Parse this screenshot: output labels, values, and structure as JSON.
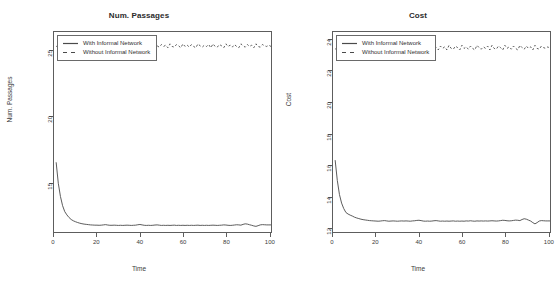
{
  "figure": {
    "background": "#ffffff",
    "line_color": "#4a4a4a",
    "axis_color": "#5d5d5d"
  },
  "panels": [
    {
      "id": "num-passages",
      "title": "Num. Passages",
      "xlabel": "Time",
      "ylabel": "Num. Passages",
      "legend": {
        "solid_label": "With Informal Network",
        "dashed_label": "Without Informal Network"
      },
      "yticks": [
        "15",
        "20",
        "25"
      ],
      "xticks": [
        "0",
        "20",
        "40",
        "60",
        "80",
        "100"
      ]
    },
    {
      "id": "cost",
      "title": "Cost",
      "xlabel": "Time",
      "ylabel": "Cost",
      "legend": {
        "solid_label": "With Informal Network",
        "dashed_label": "Without Informal Network"
      },
      "yticks": [
        "12",
        "14",
        "16",
        "18",
        "20",
        "22",
        "24"
      ],
      "xticks": [
        "0",
        "20",
        "40",
        "60",
        "80",
        "100"
      ]
    }
  ],
  "chart_data": [
    {
      "type": "line",
      "title": "Num. Passages",
      "xlabel": "Time",
      "ylabel": "Num. Passages",
      "xlim": [
        0,
        101
      ],
      "ylim": [
        11.2,
        26.4
      ],
      "grid": false,
      "legend_position": "top-left",
      "yticks": [
        15,
        20,
        25
      ],
      "xticks": [
        0,
        20,
        40,
        60,
        80,
        100
      ],
      "series": [
        {
          "name": "With Informal Network",
          "style": "solid",
          "x": [
            1,
            2,
            3,
            4,
            5,
            6,
            7,
            8,
            9,
            10,
            11,
            12,
            13,
            14,
            15,
            16,
            17,
            18,
            19,
            20,
            21,
            22,
            23,
            24,
            25,
            26,
            27,
            28,
            29,
            30,
            31,
            32,
            33,
            34,
            35,
            36,
            37,
            38,
            39,
            40,
            41,
            42,
            43,
            44,
            45,
            46,
            47,
            48,
            49,
            50,
            51,
            52,
            53,
            54,
            55,
            56,
            57,
            58,
            59,
            60,
            61,
            62,
            63,
            64,
            65,
            66,
            67,
            68,
            69,
            70,
            71,
            72,
            73,
            74,
            75,
            76,
            77,
            78,
            79,
            80,
            81,
            82,
            83,
            84,
            85,
            86,
            87,
            88,
            89,
            90,
            91,
            92,
            93,
            94,
            95,
            96,
            97,
            98,
            99,
            100,
            101
          ],
          "y": [
            16.5,
            14.9,
            13.9,
            13.2,
            12.75,
            12.5,
            12.3,
            12.15,
            12.05,
            11.98,
            11.92,
            11.87,
            11.83,
            11.8,
            11.78,
            11.76,
            11.74,
            11.73,
            11.72,
            11.72,
            11.71,
            11.72,
            11.74,
            11.76,
            11.73,
            11.71,
            11.71,
            11.72,
            11.71,
            11.7,
            11.71,
            11.7,
            11.71,
            11.72,
            11.71,
            11.7,
            11.71,
            11.72,
            11.75,
            11.77,
            11.74,
            11.71,
            11.7,
            11.71,
            11.7,
            11.71,
            11.73,
            11.74,
            11.72,
            11.7,
            11.71,
            11.7,
            11.71,
            11.7,
            11.71,
            11.72,
            11.7,
            11.71,
            11.7,
            11.71,
            11.7,
            11.71,
            11.7,
            11.71,
            11.7,
            11.71,
            11.72,
            11.7,
            11.71,
            11.7,
            11.71,
            11.7,
            11.71,
            11.72,
            11.71,
            11.7,
            11.71,
            11.72,
            11.74,
            11.73,
            11.71,
            11.7,
            11.71,
            11.73,
            11.75,
            11.74,
            11.72,
            11.78,
            11.82,
            11.8,
            11.75,
            11.71,
            11.66,
            11.63,
            11.68,
            11.74,
            11.76,
            11.75,
            11.74,
            11.74,
            11.74
          ]
        },
        {
          "name": "Without Informal Network",
          "style": "dashed",
          "x": [
            1,
            2,
            3,
            4,
            5,
            6,
            7,
            8,
            9,
            10,
            11,
            12,
            13,
            14,
            15,
            16,
            17,
            18,
            19,
            20,
            21,
            22,
            23,
            24,
            25,
            26,
            27,
            28,
            29,
            30,
            31,
            32,
            33,
            34,
            35,
            36,
            37,
            38,
            39,
            40,
            41,
            42,
            43,
            44,
            45,
            46,
            47,
            48,
            49,
            50,
            51,
            52,
            53,
            54,
            55,
            56,
            57,
            58,
            59,
            60,
            61,
            62,
            63,
            64,
            65,
            66,
            67,
            68,
            69,
            70,
            71,
            72,
            73,
            74,
            75,
            76,
            77,
            78,
            79,
            80,
            81,
            82,
            83,
            84,
            85,
            86,
            87,
            88,
            89,
            90,
            91,
            92,
            93,
            94,
            95,
            96,
            97,
            98,
            99,
            100,
            101
          ],
          "y": [
            25.3,
            25.35,
            25.2,
            25.45,
            25.3,
            25.5,
            25.2,
            25.4,
            25.25,
            25.5,
            25.3,
            25.15,
            25.45,
            25.25,
            25.4,
            25.2,
            25.45,
            25.3,
            25.25,
            25.5,
            25.3,
            25.2,
            25.45,
            25.35,
            25.6,
            25.25,
            25.45,
            25.3,
            25.5,
            25.3,
            25.2,
            25.45,
            25.3,
            25.5,
            25.25,
            25.4,
            25.3,
            25.2,
            25.45,
            25.35,
            25.5,
            25.25,
            25.35,
            25.45,
            25.3,
            25.2,
            25.5,
            25.35,
            25.25,
            25.45,
            25.3,
            25.4,
            25.2,
            25.5,
            25.3,
            25.25,
            25.45,
            25.35,
            25.2,
            25.5,
            25.3,
            25.4,
            25.25,
            25.45,
            25.3,
            25.2,
            25.5,
            25.35,
            25.25,
            25.4,
            25.3,
            25.45,
            25.2,
            25.5,
            25.3,
            25.25,
            25.45,
            25.35,
            25.2,
            25.5,
            25.3,
            25.4,
            25.25,
            25.45,
            25.3,
            25.2,
            25.5,
            25.35,
            25.25,
            25.45,
            25.3,
            25.4,
            25.2,
            25.5,
            25.3,
            25.25,
            25.45,
            25.35,
            25.3,
            25.4,
            25.3
          ]
        }
      ]
    },
    {
      "type": "line",
      "title": "Cost",
      "xlabel": "Time",
      "ylabel": "Cost",
      "xlim": [
        0,
        101
      ],
      "ylim": [
        11.7,
        24.5
      ],
      "grid": false,
      "legend_position": "top-left",
      "yticks": [
        12,
        14,
        16,
        18,
        20,
        22,
        24
      ],
      "xticks": [
        0,
        20,
        40,
        60,
        80,
        100
      ],
      "series": [
        {
          "name": "With Informal Network",
          "style": "solid",
          "x": [
            1,
            2,
            3,
            4,
            5,
            6,
            7,
            8,
            9,
            10,
            11,
            12,
            13,
            14,
            15,
            16,
            17,
            18,
            19,
            20,
            21,
            22,
            23,
            24,
            25,
            26,
            27,
            28,
            29,
            30,
            31,
            32,
            33,
            34,
            35,
            36,
            37,
            38,
            39,
            40,
            41,
            42,
            43,
            44,
            45,
            46,
            47,
            48,
            49,
            50,
            51,
            52,
            53,
            54,
            55,
            56,
            57,
            58,
            59,
            60,
            61,
            62,
            63,
            64,
            65,
            66,
            67,
            68,
            69,
            70,
            71,
            72,
            73,
            74,
            75,
            76,
            77,
            78,
            79,
            80,
            81,
            82,
            83,
            84,
            85,
            86,
            87,
            88,
            89,
            90,
            91,
            92,
            93,
            94,
            95,
            96,
            97,
            98,
            99,
            100,
            101
          ],
          "y": [
            16.3,
            15.0,
            14.1,
            13.55,
            13.2,
            12.95,
            12.85,
            12.78,
            12.72,
            12.65,
            12.6,
            12.56,
            12.52,
            12.49,
            12.47,
            12.45,
            12.43,
            12.42,
            12.41,
            12.4,
            12.39,
            12.4,
            12.42,
            12.43,
            12.41,
            12.39,
            12.4,
            12.41,
            12.4,
            12.39,
            12.4,
            12.41,
            12.4,
            12.41,
            12.4,
            12.39,
            12.41,
            12.42,
            12.44,
            12.45,
            12.43,
            12.4,
            12.39,
            12.4,
            12.39,
            12.4,
            12.42,
            12.43,
            12.41,
            12.39,
            12.4,
            12.39,
            12.4,
            12.39,
            12.4,
            12.41,
            12.39,
            12.4,
            12.39,
            12.4,
            12.39,
            12.41,
            12.4,
            12.42,
            12.4,
            12.39,
            12.41,
            12.4,
            12.41,
            12.4,
            12.41,
            12.4,
            12.41,
            12.42,
            12.41,
            12.4,
            12.41,
            12.43,
            12.45,
            12.44,
            12.42,
            12.41,
            12.42,
            12.44,
            12.46,
            12.45,
            12.43,
            12.5,
            12.55,
            12.52,
            12.46,
            12.4,
            12.3,
            12.22,
            12.3,
            12.4,
            12.43,
            12.42,
            12.41,
            12.41,
            12.41
          ]
        },
        {
          "name": "Without Informal Network",
          "style": "dashed",
          "x": [
            1,
            2,
            3,
            4,
            5,
            6,
            7,
            8,
            9,
            10,
            11,
            12,
            13,
            14,
            15,
            16,
            17,
            18,
            19,
            20,
            21,
            22,
            23,
            24,
            25,
            26,
            27,
            28,
            29,
            30,
            31,
            32,
            33,
            34,
            35,
            36,
            37,
            38,
            39,
            40,
            41,
            42,
            43,
            44,
            45,
            46,
            47,
            48,
            49,
            50,
            51,
            52,
            53,
            54,
            55,
            56,
            57,
            58,
            59,
            60,
            61,
            62,
            63,
            64,
            65,
            66,
            67,
            68,
            69,
            70,
            71,
            72,
            73,
            74,
            75,
            76,
            77,
            78,
            79,
            80,
            81,
            82,
            83,
            84,
            85,
            86,
            87,
            88,
            89,
            90,
            91,
            92,
            93,
            94,
            95,
            96,
            97,
            98,
            99,
            100,
            101
          ],
          "y": [
            23.4,
            23.5,
            23.35,
            23.6,
            23.45,
            23.65,
            23.35,
            23.55,
            23.4,
            23.65,
            23.45,
            23.3,
            23.6,
            23.4,
            23.55,
            23.35,
            23.6,
            23.45,
            23.4,
            23.7,
            23.45,
            23.35,
            23.6,
            23.5,
            23.75,
            23.4,
            23.6,
            23.45,
            23.65,
            23.45,
            23.35,
            23.6,
            23.45,
            23.65,
            23.4,
            23.55,
            23.45,
            23.35,
            23.6,
            23.5,
            23.65,
            23.4,
            23.5,
            23.6,
            23.45,
            23.3,
            23.65,
            23.5,
            23.35,
            23.6,
            23.45,
            23.55,
            23.35,
            23.65,
            23.45,
            23.4,
            23.6,
            23.5,
            23.35,
            23.65,
            23.45,
            23.55,
            23.4,
            23.6,
            23.45,
            23.35,
            23.65,
            23.5,
            23.4,
            23.55,
            23.45,
            23.6,
            23.35,
            23.65,
            23.45,
            23.4,
            23.6,
            23.5,
            23.35,
            23.65,
            23.45,
            23.55,
            23.4,
            23.6,
            23.45,
            23.35,
            23.65,
            23.5,
            23.4,
            23.6,
            23.45,
            23.55,
            23.35,
            23.65,
            23.45,
            23.4,
            23.6,
            23.5,
            23.45,
            23.55,
            23.45
          ]
        }
      ]
    }
  ]
}
